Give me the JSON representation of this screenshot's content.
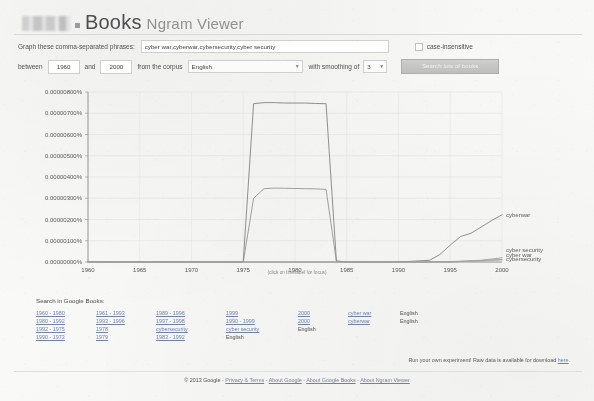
{
  "header": {
    "logo_name": "google-logo-redacted",
    "books_label": "Books",
    "ngram_label": "Ngram Viewer"
  },
  "form": {
    "phrases_label": "Graph these comma-separated phrases:",
    "phrases_value": "cyber war,cyberwar,cybersecurity,cyber security",
    "phrases_placeholder": "",
    "case_insensitive_label": "case-insensitive",
    "between_label": "between",
    "year_start": "1960",
    "year_end": "2000",
    "and_label": "and",
    "corpus_label": "from the corpus",
    "corpus_value": "English",
    "smoothing_label": "with smoothing of",
    "smoothing_value": "3",
    "search_button_label": "Search lots of books"
  },
  "chart_data": {
    "type": "line",
    "title": "",
    "caption": "(click on line/label for focus)",
    "xlabel": "",
    "ylabel": "",
    "xlim": [
      1960,
      2000
    ],
    "ylim": [
      0,
      8e-06
    ],
    "grid": true,
    "legend_position": "right-inline",
    "xticks": [
      "1960",
      "1965",
      "1970",
      "1975",
      "1980",
      "1985",
      "1990",
      "1995",
      "2000"
    ],
    "xtick_values": [
      1960,
      1965,
      1970,
      1975,
      1980,
      1985,
      1990,
      1995,
      2000
    ],
    "yticks": [
      "0.00000000%",
      "0.00000100%",
      "0.00000200%",
      "0.00000300%",
      "0.00000400%",
      "0.00000500%",
      "0.00000600%",
      "0.00000700%",
      "0.00000800%"
    ],
    "ytick_values": [
      0,
      1e-06,
      2e-06,
      3e-06,
      4e-06,
      5e-06,
      6e-06,
      7e-06,
      8e-06
    ],
    "series": [
      {
        "name": "cyberwar",
        "label": "cyberwar",
        "color": "#7a7a7a",
        "x": [
          1960,
          1974,
          1975,
          1976,
          1977,
          1978,
          1979,
          1980,
          1981,
          1982,
          1983,
          1984,
          1985,
          1990,
          1993,
          1994,
          1995,
          1996,
          1997,
          1998,
          1999,
          2000
        ],
        "values": [
          0,
          0,
          0,
          7.45e-06,
          7.5e-06,
          7.5e-06,
          7.48e-06,
          7.48e-06,
          7.48e-06,
          7.46e-06,
          7.45e-06,
          5e-08,
          0,
          0,
          8e-08,
          3.5e-07,
          8e-07,
          1.2e-06,
          1.35e-06,
          1.65e-06,
          1.95e-06,
          2.22e-06
        ]
      },
      {
        "name": "cyber war",
        "label": "cyber war",
        "color": "#8c8c8c",
        "x": [
          1960,
          1974,
          1975,
          1976,
          1977,
          1978,
          1979,
          1980,
          1981,
          1982,
          1983,
          1984,
          1985,
          1990,
          1995,
          2000
        ],
        "values": [
          0,
          0,
          0,
          3e-06,
          3.45e-06,
          3.48e-06,
          3.47e-06,
          3.46e-06,
          3.45e-06,
          3.44e-06,
          3.42e-06,
          4e-08,
          0,
          0,
          0,
          1.2e-07
        ]
      },
      {
        "name": "cyber security",
        "label": "cyber security",
        "color": "#9a9a9a",
        "x": [
          1960,
          1975,
          1980,
          1985,
          1990,
          1995,
          1998,
          2000
        ],
        "values": [
          0,
          0,
          0,
          0,
          0,
          2e-08,
          8e-08,
          2e-07
        ]
      },
      {
        "name": "cybersecurity",
        "label": "cybersecurity",
        "color": "#a8a8a8",
        "x": [
          1960,
          1975,
          1980,
          1985,
          1990,
          1995,
          1998,
          2000
        ],
        "values": [
          0,
          0,
          0,
          0,
          0,
          1e-08,
          4e-08,
          1e-07
        ]
      }
    ],
    "inline_labels": [
      {
        "text": "cyberwar",
        "at_year": 2000,
        "at_value": 2.22e-06
      },
      {
        "text": "cyber security",
        "at_year": 2000,
        "at_value": 5.5e-07
      },
      {
        "text": "cyber war",
        "at_year": 2000,
        "at_value": 3.5e-07
      },
      {
        "text": "cybersecurity",
        "at_year": 2000,
        "at_value": 1.5e-07
      }
    ]
  },
  "search_links": {
    "title": "Search in Google Books:",
    "columns": [
      {
        "links": [
          "1960 - 1980",
          "1980 - 1992",
          "1992 - 1975",
          "1990 - 1973"
        ],
        "plain": []
      },
      {
        "links": [
          "1961 - 1993",
          "1993 - 1996",
          "1978",
          "1979"
        ],
        "plain": []
      },
      {
        "links": [
          "1989 - 1996",
          "1997 - 1998",
          "cybersecurity",
          "1983 - 1992"
        ],
        "plain": []
      },
      {
        "links": [
          "1999",
          "1990 - 1999",
          "cyber security"
        ],
        "plain": [
          "English"
        ]
      },
      {
        "links": [
          "2000",
          "2000"
        ],
        "plain": [
          "English"
        ]
      },
      {
        "links": [
          "cyber war",
          "cyberwar"
        ],
        "plain": []
      },
      {
        "links": [],
        "plain": [
          "English",
          "English"
        ]
      }
    ]
  },
  "footer": {
    "experiment_text": "Run your own experiment! Raw data is available for download",
    "experiment_link": "here",
    "experiment_end": ".",
    "copyright": "© 2013 Google",
    "links": [
      "Privacy & Terms",
      "About Google",
      "About Google Books",
      "About Ngram Viewer"
    ],
    "separator": "-"
  }
}
